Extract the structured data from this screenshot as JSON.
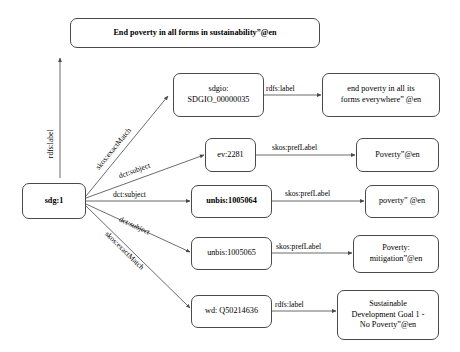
{
  "diagram": {
    "type": "directed-graph",
    "background_color": "#ffffff",
    "node_border_color": "#4a4a4a",
    "edge_color": "#5a5a5a",
    "text_color": "#000000"
  },
  "nodes": [
    {
      "id": "literal-top",
      "label": "End poverty in all forms in sustainability”@en",
      "bold": true,
      "kind": "literal"
    },
    {
      "id": "sdg1",
      "label": "sdg:1",
      "bold": true,
      "kind": "resource"
    },
    {
      "id": "sdgio",
      "label": "sdgio:\nSDGIO_00000035",
      "bold": false,
      "kind": "resource"
    },
    {
      "id": "ev2281",
      "label": "ev:2281",
      "bold": false,
      "kind": "resource"
    },
    {
      "id": "unbis1005064",
      "label": "unbis:1005064",
      "bold": true,
      "kind": "resource"
    },
    {
      "id": "unbis1005065",
      "label": "unbis:1005065",
      "bold": false,
      "kind": "resource"
    },
    {
      "id": "wdQ50214636",
      "label": "wd: Q50214636",
      "bold": false,
      "kind": "resource"
    },
    {
      "id": "literal-sdgio",
      "label": "end poverty in all its\nforms everywhere” @en",
      "bold": false,
      "kind": "literal"
    },
    {
      "id": "literal-ev",
      "label": "Poverty”@en",
      "bold": false,
      "kind": "literal"
    },
    {
      "id": "literal-unbis64",
      "label": "poverty” @en",
      "bold": false,
      "kind": "literal"
    },
    {
      "id": "literal-unbis65",
      "label": "Poverty:\nmitigation”@en",
      "bold": false,
      "kind": "literal"
    },
    {
      "id": "literal-wd",
      "label": "Sustainable\nDevelopment Goal 1 -\nNo Poverty”@en",
      "bold": false,
      "kind": "literal"
    }
  ],
  "edges": [
    {
      "id": "e-rdfs-top",
      "from": "sdg:1",
      "to": "End poverty in all forms in sustainability”@en",
      "label": "rdfs:label"
    },
    {
      "id": "e-sdgio",
      "from": "sdg:1",
      "to": "sdgio:SDGIO_00000035",
      "label": "skos:exactMatch"
    },
    {
      "id": "e-ev",
      "from": "sdg:1",
      "to": "ev:2281",
      "label": "dct:subject"
    },
    {
      "id": "e-unbis64",
      "from": "sdg:1",
      "to": "unbis:1005064",
      "label": "dct:subject"
    },
    {
      "id": "e-unbis65",
      "from": "sdg:1",
      "to": "unbis:1005065",
      "label": "dct:subject"
    },
    {
      "id": "e-wd",
      "from": "sdg:1",
      "to": "wd: Q50214636",
      "label": "skos:exactMatch"
    },
    {
      "id": "e-sdgio-lit",
      "from": "sdgio:SDGIO_00000035",
      "to": "end poverty in all its forms everywhere” @en",
      "label": "rdfs:label"
    },
    {
      "id": "e-ev-lit",
      "from": "ev:2281",
      "to": "Poverty”@en",
      "label": "skos:prefLabel"
    },
    {
      "id": "e-unbis64-lit",
      "from": "unbis:1005064",
      "to": "poverty” @en",
      "label": "skos:prefLabel"
    },
    {
      "id": "e-unbis65-lit",
      "from": "unbis:1005065",
      "to": "Poverty: mitigation”@en",
      "label": "skos:prefLabel"
    },
    {
      "id": "e-wd-lit",
      "from": "wd: Q50214636",
      "to": "Sustainable Development Goal 1 - No Poverty”@en",
      "label": "rdfs:label"
    }
  ]
}
